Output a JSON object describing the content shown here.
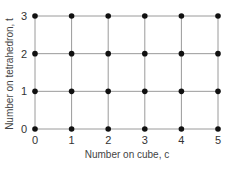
{
  "chart_data": {
    "type": "scatter",
    "title": "",
    "xlabel": "Number on cube, c",
    "ylabel": "Number on tetrahedron, t",
    "x_ticks": [
      "0",
      "1",
      "2",
      "3",
      "4",
      "5"
    ],
    "y_ticks": [
      "0",
      "1",
      "2",
      "3"
    ],
    "xlim": [
      0,
      5
    ],
    "ylim": [
      0,
      3
    ],
    "grid": true,
    "legend": null,
    "points": [
      [
        0,
        0
      ],
      [
        1,
        0
      ],
      [
        2,
        0
      ],
      [
        3,
        0
      ],
      [
        4,
        0
      ],
      [
        5,
        0
      ],
      [
        0,
        1
      ],
      [
        1,
        1
      ],
      [
        2,
        1
      ],
      [
        3,
        1
      ],
      [
        4,
        1
      ],
      [
        5,
        1
      ],
      [
        0,
        2
      ],
      [
        1,
        2
      ],
      [
        2,
        2
      ],
      [
        3,
        2
      ],
      [
        4,
        2
      ],
      [
        5,
        2
      ],
      [
        0,
        3
      ],
      [
        1,
        3
      ],
      [
        2,
        3
      ],
      [
        3,
        3
      ],
      [
        4,
        3
      ],
      [
        5,
        3
      ]
    ],
    "marker_color": "#111111",
    "grid_color": "#9a9a9a"
  }
}
